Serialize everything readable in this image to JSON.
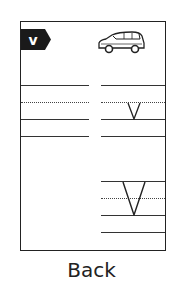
{
  "card": {
    "badge_letter": "v",
    "badge_icon": "hexagon-badge-icon",
    "picture_icon": "van-icon",
    "upper_example_letter": "v",
    "lower_example_letter": "V"
  },
  "caption": "Back",
  "colors": {
    "ink": "#222222",
    "background": "#ffffff"
  }
}
